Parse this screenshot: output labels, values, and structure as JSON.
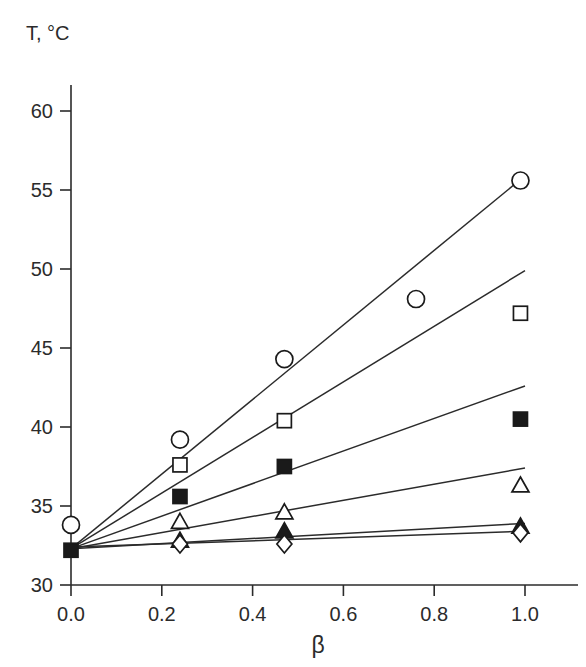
{
  "chart_data": {
    "type": "scatter",
    "title": "",
    "subtitle": "",
    "xlabel": "β",
    "ylabel": "T, °C",
    "xlim": [
      0.0,
      1.12
    ],
    "ylim": [
      30,
      62
    ],
    "xticks": [
      0.0,
      0.2,
      0.4,
      0.6,
      0.8,
      1.0
    ],
    "xtick_labels": [
      "0.0",
      "0.2",
      "0.4",
      "0.6",
      "0.8",
      "1.0"
    ],
    "yticks": [
      30,
      35,
      40,
      45,
      50,
      55,
      60
    ],
    "ytick_labels": [
      "30",
      "35",
      "40",
      "45",
      "50",
      "55",
      "60"
    ],
    "grid": false,
    "legend": "none",
    "marker_color": "#1a1a1a",
    "line_color": "#2b2b2b",
    "background": "#ffffff",
    "series": [
      {
        "name": "series-1",
        "marker": "open-circle",
        "filled": false,
        "x": [
          0.0,
          0.24,
          0.47,
          0.76,
          0.99
        ],
        "y": [
          33.8,
          39.2,
          44.3,
          48.1,
          55.6
        ],
        "fit_line": {
          "x0": 0.0,
          "y0": 32.3,
          "x1": 1.0,
          "y1": 55.9
        }
      },
      {
        "name": "series-2",
        "marker": "open-square",
        "filled": false,
        "x": [
          0.24,
          0.47,
          0.99
        ],
        "y": [
          37.6,
          40.4,
          47.2
        ],
        "fit_line": {
          "x0": 0.0,
          "y0": 32.3,
          "x1": 1.0,
          "y1": 49.9
        }
      },
      {
        "name": "series-3",
        "marker": "filled-square",
        "filled": true,
        "x": [
          0.0,
          0.24,
          0.47,
          0.99
        ],
        "y": [
          32.2,
          35.6,
          37.5,
          40.5
        ],
        "fit_line": {
          "x0": 0.0,
          "y0": 32.3,
          "x1": 1.0,
          "y1": 42.6
        }
      },
      {
        "name": "series-4",
        "marker": "open-triangle",
        "filled": false,
        "x": [
          0.24,
          0.47,
          0.99
        ],
        "y": [
          34.0,
          34.6,
          36.3
        ],
        "fit_line": {
          "x0": 0.0,
          "y0": 32.3,
          "x1": 1.0,
          "y1": 37.4
        }
      },
      {
        "name": "series-5",
        "marker": "filled-triangle",
        "filled": true,
        "x": [
          0.24,
          0.47,
          0.99
        ],
        "y": [
          32.8,
          33.4,
          33.7
        ],
        "fit_line": {
          "x0": 0.0,
          "y0": 32.3,
          "x1": 1.0,
          "y1": 33.9
        }
      },
      {
        "name": "series-6",
        "marker": "open-diamond",
        "filled": false,
        "x": [
          0.24,
          0.47,
          0.99
        ],
        "y": [
          32.6,
          32.6,
          33.3
        ],
        "fit_line": {
          "x0": 0.0,
          "y0": 32.4,
          "x1": 1.0,
          "y1": 33.4
        }
      }
    ]
  }
}
